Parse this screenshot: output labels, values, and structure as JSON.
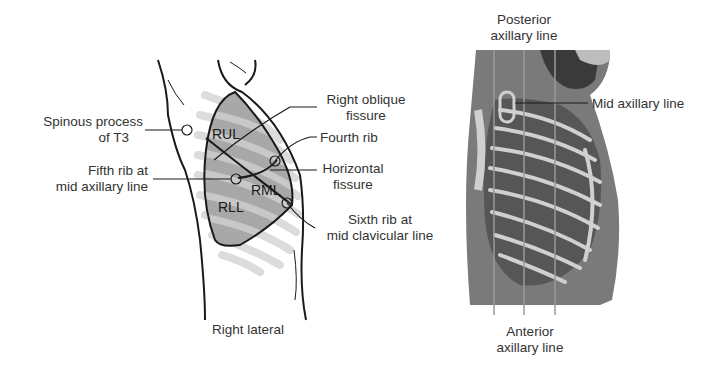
{
  "figure": {
    "left_panel": {
      "caption": "Right lateral",
      "lobes": {
        "upper": "RUL",
        "middle": "RML",
        "lower": "RLL"
      },
      "labels": {
        "spinous_process": [
          "Spinous process",
          "of T3"
        ],
        "fifth_rib": [
          "Fifth rib at",
          "mid axillary line"
        ],
        "oblique_fissure": [
          "Right oblique",
          "fissure"
        ],
        "fourth_rib": [
          "Fourth rib"
        ],
        "horizontal_fissure": [
          "Horizontal",
          "fissure"
        ],
        "sixth_rib": [
          "Sixth rib at",
          "mid clavicular line"
        ]
      }
    },
    "right_panel": {
      "labels": {
        "posterior": [
          "Posterior",
          "axillary line"
        ],
        "mid": [
          "Mid axillary line"
        ],
        "anterior": [
          "Anterior",
          "axillary line"
        ]
      }
    },
    "colors": {
      "outline": "#1a1a1a",
      "lung_fill": "#a8a8a8",
      "rib_light": "#d9d9d9",
      "photo_body": "#6e6e6e",
      "photo_dark": "#4a4a4a",
      "photo_rib": "#cfcfcf"
    }
  }
}
